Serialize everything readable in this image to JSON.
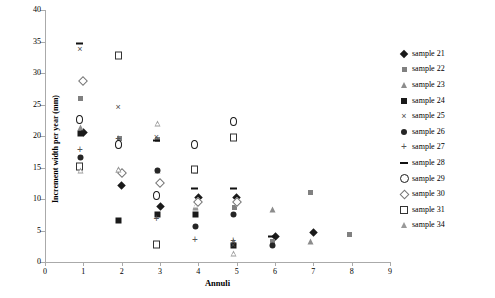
{
  "chart_data": {
    "type": "scatter",
    "title": "",
    "xlabel": "Annuli",
    "ylabel": "Increment width per year (mm)",
    "xlim": [
      0,
      9
    ],
    "ylim": [
      0,
      40
    ],
    "xticks": [
      0,
      1,
      2,
      3,
      4,
      5,
      6,
      7,
      8,
      9
    ],
    "yticks": [
      0,
      5,
      10,
      15,
      20,
      25,
      30,
      35,
      40
    ],
    "grid": false,
    "legend_position": "right",
    "x": [
      1,
      2,
      3,
      4,
      5,
      6,
      7,
      8
    ],
    "series": [
      {
        "name": "sample 21",
        "marker": "diamond",
        "x": [
          1,
          2,
          3,
          4,
          5,
          6,
          7
        ],
        "values": [
          20.5,
          12.2,
          8.8,
          10.3,
          10.3,
          4.0,
          4.7
        ]
      },
      {
        "name": "sample 22",
        "marker": "sqgrey",
        "x": [
          1,
          2,
          3,
          4,
          5,
          6,
          7,
          8
        ],
        "values": [
          25.6,
          19.2,
          19.0,
          14.0,
          8.2,
          2.8,
          10.6,
          4.0
        ]
      },
      {
        "name": "sample 23",
        "marker": "trigrey",
        "x": [
          1,
          2,
          3,
          4,
          5,
          6,
          7
        ],
        "values": [
          20.9,
          14.2,
          14.1,
          8.2,
          2.8,
          7.9,
          2.8
        ]
      },
      {
        "name": "sample 24",
        "marker": "sqblack",
        "x": [
          1,
          2,
          3,
          4,
          5
        ],
        "values": [
          19.9,
          6.1,
          7.0,
          7.0,
          2.2
        ]
      },
      {
        "name": "sample 25",
        "marker": "x",
        "x": [
          1,
          2,
          3,
          4,
          5
        ],
        "values": [
          33.2,
          23.9,
          19.2,
          14.2,
          2.0
        ]
      },
      {
        "name": "sample 26",
        "marker": "circfill",
        "x": [
          1,
          2,
          3,
          4,
          5,
          6
        ],
        "values": [
          16.1,
          18.0,
          14.1,
          5.1,
          7.0,
          2.2
        ]
      },
      {
        "name": "sample 27",
        "marker": "plus",
        "x": [
          1,
          2,
          3,
          4,
          5
        ],
        "values": [
          17.2,
          18.9,
          6.3,
          2.9,
          2.8
        ]
      },
      {
        "name": "sample 28",
        "marker": "dash",
        "x": [
          1,
          2,
          3,
          4,
          5,
          6
        ],
        "values": [
          34.5,
          18.5,
          19.2,
          11.5,
          11.5,
          3.9
        ]
      },
      {
        "name": "sample 29",
        "marker": "circopen",
        "x": [
          1,
          2,
          3,
          4,
          5
        ],
        "values": [
          21.9,
          18.0,
          9.8,
          17.9,
          21.6
        ]
      },
      {
        "name": "sample 30",
        "marker": "diaopen",
        "x": [
          1,
          2,
          3,
          4,
          5
        ],
        "values": [
          28.7,
          14.2,
          12.6,
          9.6,
          9.5
        ]
      },
      {
        "name": "sample 31",
        "marker": "sqopen",
        "x": [
          1,
          2,
          3,
          4,
          5
        ],
        "values": [
          14.6,
          32.1,
          2.2,
          14.0,
          19.1
        ]
      },
      {
        "name": "sample 34",
        "marker": "triopen",
        "x": [
          1,
          2,
          3,
          4,
          5
        ],
        "values": [
          14.0,
          14.2,
          21.5,
          8.4,
          0.8
        ]
      }
    ]
  }
}
